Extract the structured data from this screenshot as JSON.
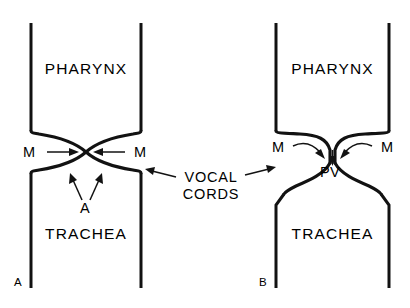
{
  "figure": {
    "background_color": "#ffffff",
    "ink_color": "#121212",
    "panels": [
      {
        "id": "A",
        "panel_letter": "A",
        "pharynx_label": "PHARYNX",
        "trachea_label": "TRACHEA",
        "muscle_label_left": "M",
        "muscle_label_right": "M",
        "airflow_label": "A",
        "description": "closed vocal cords, bulging convex cords meeting at midline"
      },
      {
        "id": "B",
        "panel_letter": "B",
        "pharynx_label": "PHARYNX",
        "trachea_label": "TRACHEA",
        "muscle_label_left": "M",
        "muscle_label_right": "M",
        "pressure_label": "PV",
        "description": "narrow V shaped glottic slit with curved inward arrows"
      }
    ],
    "center_label": {
      "line1": "VOCAL",
      "line2": "CORDS"
    }
  }
}
